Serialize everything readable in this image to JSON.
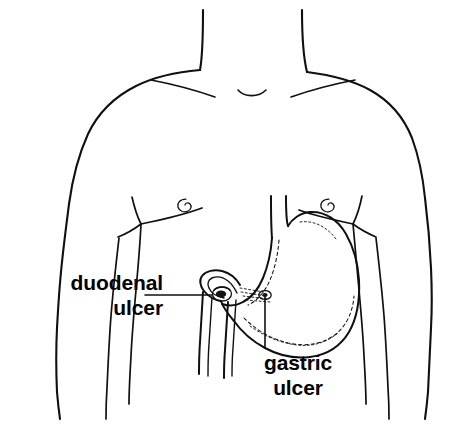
{
  "figure": {
    "background_color": "#ffffff",
    "ink_color": "#101010",
    "width": 461,
    "height": 425
  },
  "labels": {
    "duodenal": {
      "line1": "duodenal",
      "line2": "ulcer"
    },
    "gastric": {
      "line1": "gastric",
      "line2": "ulcer"
    }
  },
  "anatomy": {
    "torso": "male-torso-outline",
    "neck": "neck-outline",
    "clavicles": "clavicle-lines",
    "nipple_left": "left-nipple",
    "nipple_right": "right-nipple",
    "esophagus": "esophagus",
    "stomach": "stomach",
    "duodenum": "duodenum",
    "pylorus": "pylorus",
    "rugae": "gastric-rugae-lining"
  },
  "markers": {
    "duodenal_ulcer": {
      "name": "duodenal-ulcer-lesion",
      "x": 222,
      "y": 295
    },
    "gastric_ulcer": {
      "name": "gastric-ulcer-lesion",
      "x": 265,
      "y": 296
    }
  },
  "leaders": {
    "duodenal": "horizontal-leader-line",
    "gastric": "vertical-leader-line"
  }
}
